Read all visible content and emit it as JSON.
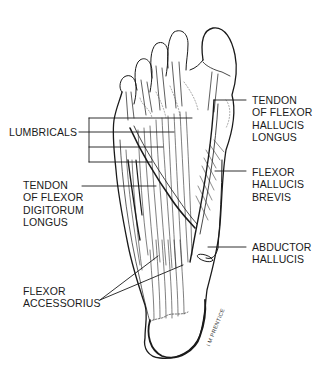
{
  "figure": {
    "labels": {
      "lumbricals": "LUMBRICALS",
      "tendon_fdl": "TENDON\nOF FLEXOR\nDIGITORUM\nLONGUS",
      "flexor_accessorius": "FLEXOR\nACCESSORIUS",
      "tendon_fhl": "TENDON\nOF FLEXOR\nHALLUCIS\nLONGUS",
      "flexor_hallucis_brevis": "FLEXOR\nHALLUCIS\nBREVIS",
      "abductor_hallucis": "ABDUCTOR\nHALLUCIS"
    },
    "signature": "I M PRENTICE",
    "colors": {
      "ink": "#1a1a1a",
      "background": "#ffffff",
      "shade": "#e8e8e8"
    }
  }
}
